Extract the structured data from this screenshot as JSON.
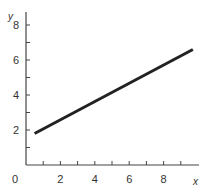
{
  "chart_data": {
    "type": "line",
    "title": "",
    "xlabel": "x",
    "ylabel": "y",
    "xlim": [
      0,
      10
    ],
    "ylim": [
      0,
      8.8
    ],
    "grid": false,
    "legend": null,
    "x_ticks": [
      2,
      4,
      6,
      8
    ],
    "x_minor_ticks": [
      1,
      2,
      3,
      4,
      5,
      6,
      7,
      8,
      9
    ],
    "y_ticks": [
      2,
      4,
      6,
      8
    ],
    "y_minor_ticks": [
      1,
      2,
      3,
      4,
      5,
      6,
      7,
      8
    ],
    "origin_label": "0",
    "series": [
      {
        "name": "line",
        "color": "#222222",
        "x": [
          0.5,
          9.7
        ],
        "y": [
          1.8,
          6.6
        ]
      }
    ]
  }
}
